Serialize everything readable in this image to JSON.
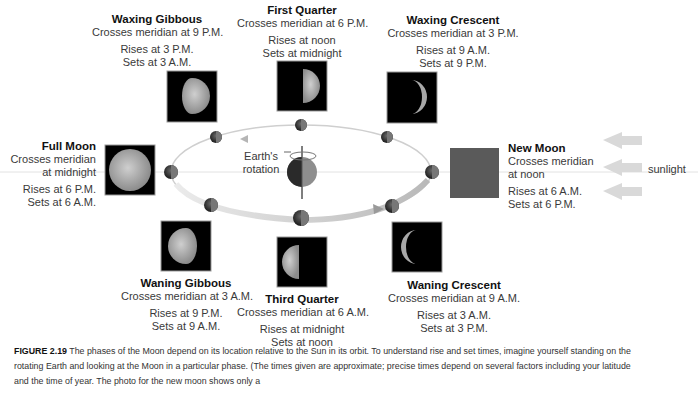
{
  "phases": [
    {
      "id": "waxing-gibbous",
      "title": "Waxing Gibbous",
      "meridian": "Crosses meridian at 9 P.M.",
      "rises": "Rises at 3 P.M.",
      "sets": "Sets at 3 A.M.",
      "illumination": "gibbous-right"
    },
    {
      "id": "first-quarter",
      "title": "First Quarter",
      "meridian": "Crosses meridian at 6 P.M.",
      "rises": "Rises at noon",
      "sets": "Sets at midnight",
      "illumination": "half-right"
    },
    {
      "id": "waxing-crescent",
      "title": "Waxing Crescent",
      "meridian": "Crosses meridian at 3 P.M.",
      "rises": "Rises at 9 A.M.",
      "sets": "Sets at 9 P.M.",
      "illumination": "crescent-right"
    },
    {
      "id": "full-moon",
      "title": "Full Moon",
      "meridian_line1": "Crosses meridian",
      "meridian_line2": "at midnight",
      "rises": "Rises at 6 P.M.",
      "sets": "Sets at 6 A.M.",
      "illumination": "full"
    },
    {
      "id": "new-moon",
      "title": "New Moon",
      "meridian_line1": "Crosses meridian",
      "meridian_line2": "at noon",
      "rises": "Rises at 6 A.M.",
      "sets": "Sets at 6 P.M.",
      "illumination": "none"
    },
    {
      "id": "waning-gibbous",
      "title": "Waning Gibbous",
      "meridian": "Crosses meridian at 3 A.M.",
      "rises": "Rises at 9 P.M.",
      "sets": "Sets at 9 A.M.",
      "illumination": "gibbous-left"
    },
    {
      "id": "third-quarter",
      "title": "Third Quarter",
      "meridian": "Crosses meridian at 6 A.M.",
      "rises": "Rises at midnight",
      "sets": "Sets at noon",
      "illumination": "half-left"
    },
    {
      "id": "waning-crescent",
      "title": "Waning Crescent",
      "meridian": "Crosses meridian at 9 A.M.",
      "rises": "Rises at 3 A.M.",
      "sets": "Sets at 3 P.M.",
      "illumination": "crescent-left"
    }
  ],
  "center": {
    "rotation_label_line1": "Earth's",
    "rotation_label_line2": "rotation"
  },
  "sunlight_label": "sunlight",
  "caption": {
    "figure_label": "FIGURE 2.19",
    "text": "The phases of the Moon depend on its location relative to the Sun in its orbit. To understand rise and set times, imagine yourself standing on the rotating Earth and looking at the Moon in a particular phase. (The times given are approximate; precise times depend on several factors including your latitude and the time of year. The photo for the new moon shows only a"
  },
  "colors": {
    "orbit": "#d8d8d8",
    "photo_bg": "#000000",
    "new_moon_square": "#5a5a5a",
    "arrow": "#d6d6d6",
    "moon_dark": "#1e1e1e",
    "moon_light": "#8a8a8a"
  }
}
